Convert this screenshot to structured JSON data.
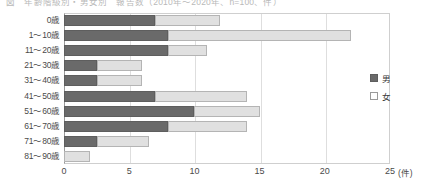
{
  "caption": {
    "text": "図　年齢階級別・男女別　報告数（2010年～2020年、n=100、件）"
  },
  "legend": {
    "position": "right",
    "items": [
      {
        "label": "男",
        "key": "male",
        "color": "#6a6a6a"
      },
      {
        "label": "女",
        "key": "female",
        "color": "#e0e0e0"
      }
    ]
  },
  "axis": {
    "x_unit": "(件)",
    "x_ticks": [
      "0",
      "5",
      "10",
      "15",
      "20",
      "25"
    ]
  },
  "chart_data": {
    "type": "bar",
    "orientation": "horizontal",
    "stacked": true,
    "title": "",
    "xlabel": "(件)",
    "ylabel": "",
    "xlim": [
      0,
      25
    ],
    "grid": true,
    "legend_position": "right",
    "categories": [
      "0歳",
      "1～10歳",
      "11～20歳",
      "21～30歳",
      "31～40歳",
      "41～50歳",
      "51～60歳",
      "61～70歳",
      "71～80歳",
      "81～90歳"
    ],
    "series": [
      {
        "name": "男",
        "color": "#6a6a6a",
        "values": [
          7,
          8,
          8,
          2.5,
          2.5,
          7,
          10,
          8,
          2.5,
          0
        ]
      },
      {
        "name": "女",
        "color": "#e0e0e0",
        "values": [
          5,
          14,
          3,
          3.5,
          3.5,
          7,
          5,
          6,
          4,
          2
        ]
      }
    ],
    "totals": [
      12,
      22,
      11,
      6,
      6,
      14,
      15,
      14,
      6.5,
      2
    ]
  }
}
